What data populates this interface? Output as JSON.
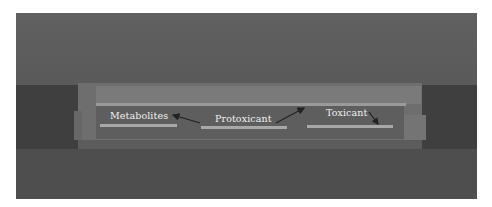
{
  "figure": {
    "type": "grayscale device schematic photo",
    "labels": {
      "metabolites": "Metabolites",
      "protoxicant": "Protoxicant",
      "toxicant": "Toxicant"
    },
    "arrows": [
      {
        "from": "protoxicant",
        "to": "metabolites"
      },
      {
        "from": "protoxicant",
        "to": "channel-right"
      },
      {
        "from": "toxicant",
        "to": "toxicant-pad"
      }
    ],
    "colors": {
      "background": "#5c5c5c",
      "device": "#6e6e6e",
      "channel": "#9a9a9a",
      "label_text": "#f0f0f0",
      "arrow": "#222222"
    }
  }
}
